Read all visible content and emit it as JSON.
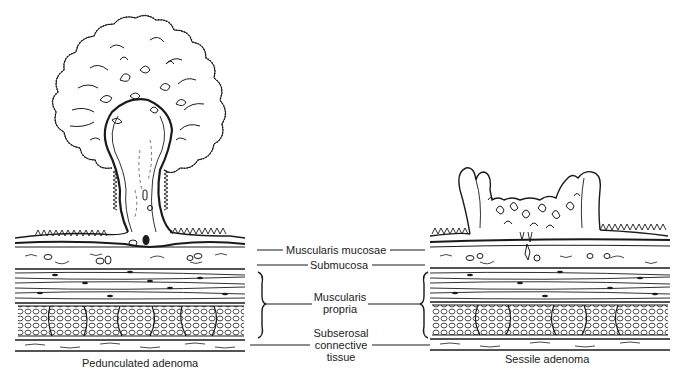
{
  "figure": {
    "left_title": "Pedunculated adenoma",
    "right_title": "Sessile adenoma",
    "layers": [
      {
        "id": "muscularis_mucosae",
        "lines": [
          "Muscularis mucosae"
        ]
      },
      {
        "id": "submucosa",
        "lines": [
          "Submucosa"
        ]
      },
      {
        "id": "muscularis_propria",
        "lines": [
          "Muscularis",
          "propria"
        ]
      },
      {
        "id": "subserosal",
        "lines": [
          "Subserosal",
          "connective",
          "tissue"
        ]
      }
    ]
  },
  "labels": {
    "mm": "Muscularis mucosae",
    "sub": "Submucosa",
    "mp1": "Muscularis",
    "mp2": "propria",
    "ss1": "Subserosal",
    "ss2": "connective",
    "ss3": "tissue"
  },
  "colors": {
    "ink": "#1a1a1a",
    "background": "#ffffff"
  }
}
